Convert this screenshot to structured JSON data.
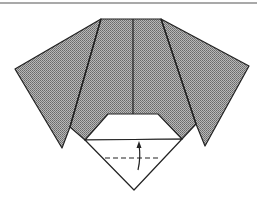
{
  "diagram": {
    "type": "origami-fold-step",
    "colors": {
      "paper_colored": "#9a9a9a",
      "paper_white": "#ffffff",
      "line": "#222222",
      "rule": "#555555"
    },
    "annotations": {
      "valley_fold_line": "dashed",
      "arrow": "fold up"
    }
  }
}
